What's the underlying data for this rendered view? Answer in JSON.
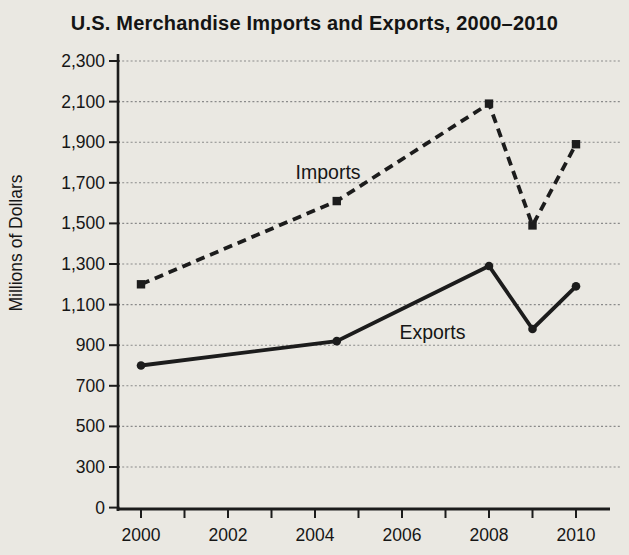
{
  "title": "U.S. Merchandise Imports and Exports, 2000–2010",
  "chart_data": {
    "type": "line",
    "title": "U.S. Merchandise Imports and Exports, 2000–2010",
    "xlabel": "",
    "ylabel": "Millions of Dollars",
    "x_range": [
      2000,
      2010
    ],
    "ylim": [
      0,
      2300
    ],
    "grid": true,
    "legend_position": "inline-labels-on-chart",
    "y_axis": {
      "note": "ticks equally spaced on page; lowest interval spans 0-300, all higher intervals span 200",
      "ticks": [
        {
          "value": 2300,
          "label": "2,300"
        },
        {
          "value": 2100,
          "label": "2,100"
        },
        {
          "value": 1900,
          "label": "1,900"
        },
        {
          "value": 1700,
          "label": "1,700"
        },
        {
          "value": 1500,
          "label": "1,500"
        },
        {
          "value": 1300,
          "label": "1,300"
        },
        {
          "value": 1100,
          "label": "1,100"
        },
        {
          "value": 900,
          "label": "900"
        },
        {
          "value": 700,
          "label": "700"
        },
        {
          "value": 500,
          "label": "500"
        },
        {
          "value": 300,
          "label": "300"
        },
        {
          "value": 0,
          "label": "0"
        }
      ]
    },
    "x_axis": {
      "tick_years": [
        2000,
        2001,
        2002,
        2003,
        2004,
        2005,
        2006,
        2007,
        2008,
        2009,
        2010
      ],
      "labels": [
        {
          "year": 2000,
          "text": "2000"
        },
        {
          "year": 2002,
          "text": "2002"
        },
        {
          "year": 2004,
          "text": "2004"
        },
        {
          "year": 2006,
          "text": "2006"
        },
        {
          "year": 2008,
          "text": "2008"
        },
        {
          "year": 2010,
          "text": "2010"
        }
      ]
    },
    "series": [
      {
        "name": "Imports",
        "line_style": "dashed",
        "marker": "square",
        "x": [
          2000,
          2004.5,
          2008,
          2009,
          2010
        ],
        "values": [
          1200,
          1610,
          2090,
          1490,
          1890
        ],
        "label": {
          "text": "Imports",
          "x": 2004.3,
          "y": 1755
        }
      },
      {
        "name": "Exports",
        "line_style": "solid",
        "marker": "circle",
        "x": [
          2000,
          2004.5,
          2008,
          2009,
          2010
        ],
        "values": [
          800,
          920,
          1290,
          980,
          1190
        ],
        "label": {
          "text": "Exports",
          "x": 2006.7,
          "y": 965
        }
      }
    ],
    "colors": {
      "background": "#eae8e2",
      "line": "#1c1c1c",
      "grid": "#8a8a8a",
      "text": "#161616"
    }
  }
}
